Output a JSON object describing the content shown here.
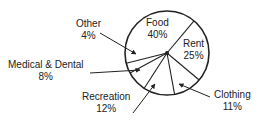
{
  "chart_data": {
    "type": "pie",
    "title": "",
    "categories": [
      "Food",
      "Rent",
      "Clothing",
      "Recreation",
      "Medical & Dental",
      "Other"
    ],
    "values": [
      40,
      25,
      11,
      12,
      8,
      4
    ],
    "unit": "%",
    "labels": [
      {
        "name": "Food",
        "pct": "40%",
        "placement": "inside"
      },
      {
        "name": "Rent",
        "pct": "25%",
        "placement": "inside"
      },
      {
        "name": "Clothing",
        "pct": "11%",
        "placement": "outside-arrow"
      },
      {
        "name": "Recreation",
        "pct": "12%",
        "placement": "outside-arrow"
      },
      {
        "name": "Medical & Dental",
        "pct": "8%",
        "placement": "outside-arrow"
      },
      {
        "name": "Other",
        "pct": "4%",
        "placement": "outside-arrow"
      }
    ],
    "legend": "none",
    "colors": {
      "stroke": "#222222",
      "fill": "#ffffff"
    }
  }
}
